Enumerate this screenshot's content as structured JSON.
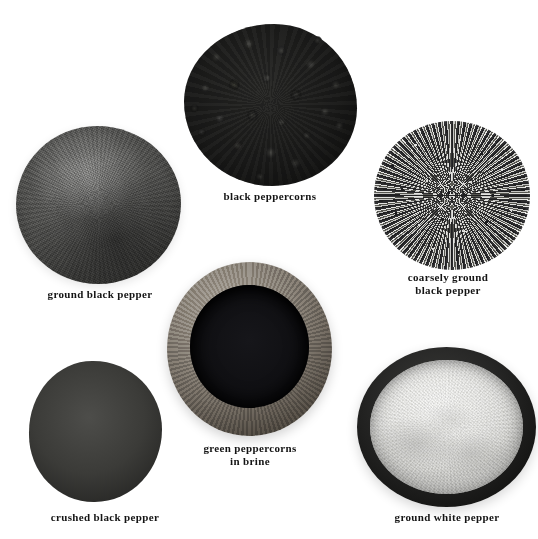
{
  "plate": {
    "title": "pepper varieties photographic plate",
    "background_color": "#ffffff",
    "caption_color": "#141414",
    "width": 538,
    "height": 539
  },
  "specimens": [
    {
      "id": "ground-black-pepper",
      "label": "ground black pepper",
      "form": "fine powder mound",
      "container": "none",
      "tone": "dark grey",
      "color": "#555553"
    },
    {
      "id": "black-peppercorns",
      "label": "black peppercorns",
      "form": "whole dried berries pile",
      "container": "none",
      "tone": "near black",
      "color": "#1d1d1c"
    },
    {
      "id": "coarsely-ground-black-pepper",
      "label": "coarsely ground\nblack pepper",
      "form": "coarse granules mound",
      "container": "none",
      "tone": "speckled grey",
      "color": "#7a7a77"
    },
    {
      "id": "green-peppercorns-in-brine",
      "label": "green peppercorns\nin brine",
      "form": "whole wet berries",
      "container": "wooden bowl",
      "tone": "mid grey spheres",
      "color": "#8e8e86"
    },
    {
      "id": "crushed-black-pepper",
      "label": "crushed black pepper",
      "form": "cracked chunky flakes mound",
      "container": "none",
      "tone": "high contrast black and cream",
      "color": "#3b3b38"
    },
    {
      "id": "ground-white-pepper",
      "label": "ground white pepper",
      "form": "fine powder",
      "container": "dark bowl",
      "tone": "pale off-white",
      "color": "#e9e9e6"
    }
  ]
}
